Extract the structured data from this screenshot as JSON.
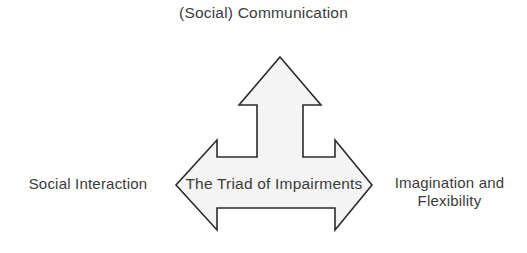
{
  "diagram": {
    "title": "The Triad of Impairments",
    "shape": {
      "name": "three-way-arrow",
      "fill_color": "#f4f4f4",
      "stroke_color": "#2b2b2b",
      "stroke_width": 1.6,
      "background_color": "#ffffff"
    },
    "center_label": "The Triad of Impairments",
    "arms": [
      {
        "id": "top",
        "direction": "up",
        "label": "(Social) Communication"
      },
      {
        "id": "left",
        "direction": "left",
        "label": "Social Interaction"
      },
      {
        "id": "right",
        "direction": "right",
        "label_line_1": "Imagination and",
        "label_line_2": "Flexibility"
      }
    ],
    "text_color": "#3b3b3b"
  }
}
